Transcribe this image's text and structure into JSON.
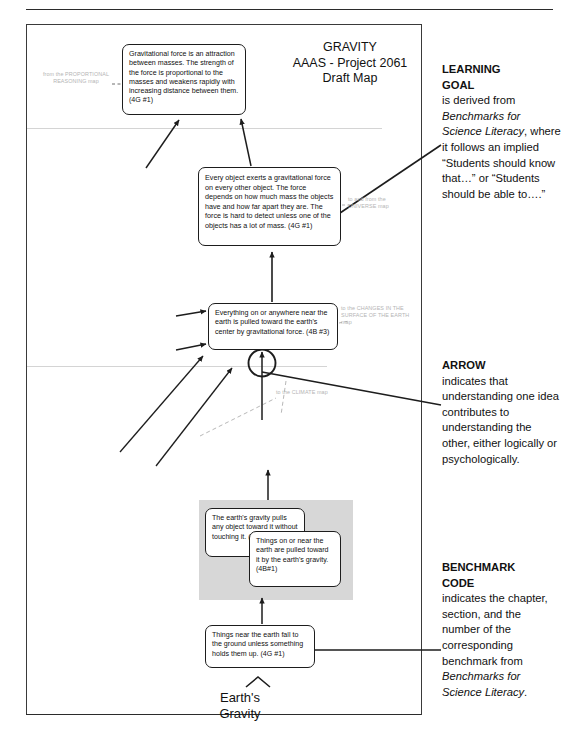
{
  "map": {
    "title_lines": [
      "GRAVITY",
      "AAAS - Project 2061",
      "Draft Map"
    ],
    "bottom_caption_lines": [
      "Earth's",
      "Gravity"
    ]
  },
  "nodes": [
    {
      "id": "gravitational-force",
      "text": "Gravitational force is an attraction between masses.  The strength of the force is proportional to the masses and weakens rapidly with increasing distance between them. (4G #1)",
      "code": "4G #1"
    },
    {
      "id": "every-object",
      "text": "Every object exerts a gravitational force on every other object.  The force depends on how much mass the objects have and how far apart they are.  The force is hard to detect unless one of the objects has a lot of mass. (4G #1)",
      "code": "4G #1"
    },
    {
      "id": "everything-near-earth",
      "text": "Everything on or anywhere near the earth is pulled toward the earth's center by gravitational force. (4B #3)",
      "code": "4B #3"
    },
    {
      "id": "earths-gravity-pulls",
      "text": "The earth's gravity pulls any object toward it without touching it. (4G #1)",
      "code": "4G #1"
    },
    {
      "id": "things-on-or-near",
      "text": "Things on or near the earth are pulled toward it by the earth's gravity. (4B#1)",
      "code": "4B#1"
    },
    {
      "id": "things-near-fall",
      "text": "Things near the earth fall to the ground unless something holds them up.  (4G #1)",
      "code": "4G #1"
    }
  ],
  "offmap_links": {
    "proportional_reasoning": "from the PROPORTIONAL REASONING map",
    "universe": "to and from the UNIVERSE map",
    "changes_surface_earth": "to the CHANGES IN THE SURFACE OF THE EARTH map",
    "climate": "to the CLIMATE map"
  },
  "legend": {
    "learning_goal": {
      "heading_line1": "LEARNING",
      "heading_line2": "GOAL",
      "body_a": "is derived from ",
      "italic_a": "Benchmarks for Science Literacy",
      "body_b": ", where it follows an implied “Students should know that…” or “Students should be able to….”"
    },
    "arrow": {
      "heading": "ARROW",
      "body": "indicates that understanding one idea contributes to understanding the other, either logically or psychologically."
    },
    "benchmark_code": {
      "heading_line1": "BENCHMARK",
      "heading_line2": "CODE",
      "body_a": "indicates the chapter, section, and the number of the corresponding benchmark from ",
      "italic_a": "Benchmarks for Science Literacy",
      "body_b": "."
    }
  },
  "colors": {
    "ink": "#1a1a1a",
    "offmap_gray": "#b4b4b4",
    "band_gray": "#d7d7d7",
    "frame": "#3a3a3a"
  }
}
